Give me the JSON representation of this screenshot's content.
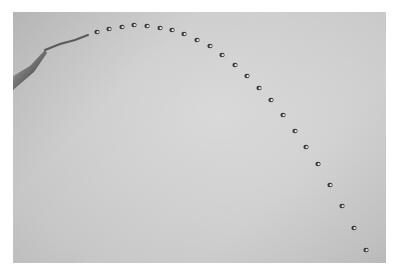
{
  "image": {
    "description": "Black-and-white photograph of water droplets ejected from a nozzle tracing a parabolic trajectory",
    "colors": {
      "border": "#ffffff",
      "background": "#d0d0d0",
      "droplet": "#3a3a3a",
      "droplet_highlight": "#f0f0f0",
      "nozzle": "#5a5a5a"
    },
    "nozzle": {
      "tip": [
        45,
        50
      ],
      "base": [
        13,
        86
      ]
    },
    "stream": [
      [
        45,
        50
      ],
      [
        60,
        44
      ],
      [
        75,
        40
      ],
      [
        88,
        35
      ]
    ],
    "droplets": [
      [
        97,
        32
      ],
      [
        109,
        29
      ],
      [
        122,
        27
      ],
      [
        134,
        25
      ],
      [
        147,
        26
      ],
      [
        160,
        28
      ],
      [
        172,
        30
      ],
      [
        184,
        34
      ],
      [
        197,
        40
      ],
      [
        210,
        46
      ],
      [
        222,
        55
      ],
      [
        235,
        65
      ],
      [
        247,
        76
      ],
      [
        259,
        88
      ],
      [
        271,
        100
      ],
      [
        283,
        115
      ],
      [
        295,
        131
      ],
      [
        306,
        147
      ],
      [
        318,
        164
      ],
      [
        330,
        185
      ],
      [
        342,
        206
      ],
      [
        354,
        228
      ],
      [
        366,
        250
      ]
    ]
  }
}
